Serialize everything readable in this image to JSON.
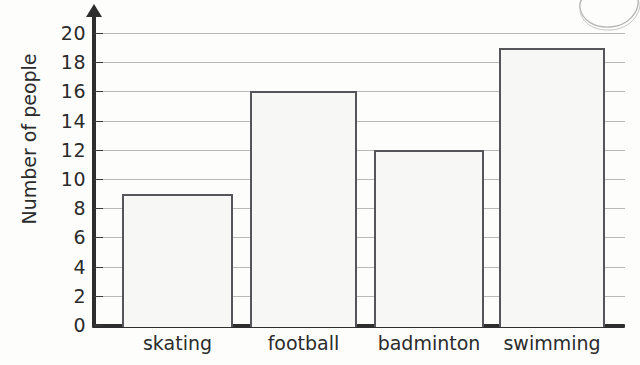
{
  "chart_data": {
    "type": "bar",
    "title": "",
    "xlabel": "",
    "ylabel": "Number of people",
    "categories": [
      "skating",
      "football",
      "badminton",
      "swimming"
    ],
    "values": [
      9,
      16,
      12,
      19
    ],
    "ylim": [
      0,
      20
    ],
    "ytick_step": 2,
    "yticks": [
      20,
      18,
      16,
      14,
      12,
      10,
      8,
      6,
      4,
      2,
      0
    ],
    "grid": "horizontal",
    "legend": "none",
    "bar_fill_color": "#f7f7f6",
    "bar_border_color": "#55555a",
    "gridline_color": "#b9b9b9",
    "axis_color": "#2e2e2e",
    "background_color": "#fdfdfb",
    "annotations": [
      "curved pen doodle artifact in top-right corner"
    ]
  },
  "axis": {
    "y_title": "Number of people"
  }
}
